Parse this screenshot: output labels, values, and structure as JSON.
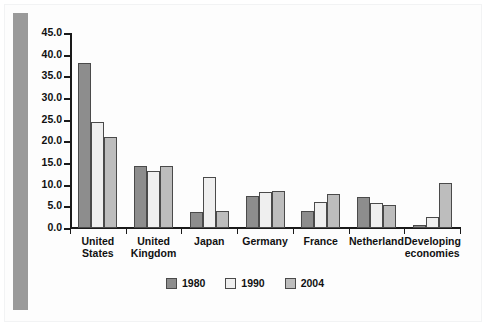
{
  "chart_data": {
    "type": "bar",
    "title": "",
    "subtitle": "",
    "xlabel": "",
    "ylabel": "",
    "ylim": [
      0.0,
      45.0
    ],
    "ytick_step": 5.0,
    "ytick_labels": [
      "0.0",
      "5.0",
      "10.0",
      "15.0",
      "20.0",
      "25.0",
      "30.0",
      "35.0",
      "40.0",
      "45.0"
    ],
    "ytick_values": [
      0.0,
      5.0,
      10.0,
      15.0,
      20.0,
      25.0,
      30.0,
      35.0,
      40.0,
      45.0
    ],
    "grid": false,
    "legend_position": "bottom-center",
    "categories": [
      "United States",
      "United Kingdom",
      "Japan",
      "Germany",
      "France",
      "Netherland",
      "Developing economies"
    ],
    "category_lines": [
      [
        "United",
        "States"
      ],
      [
        "United",
        "Kingdom"
      ],
      [
        "Japan"
      ],
      [
        "Germany"
      ],
      [
        "France"
      ],
      [
        "Netherland"
      ],
      [
        "Developing",
        "economies"
      ]
    ],
    "series": [
      {
        "name": "1980",
        "color": "#8d8d8d",
        "values": [
          38.0,
          14.3,
          3.6,
          7.4,
          4.0,
          7.1,
          0.6
        ]
      },
      {
        "name": "1990",
        "color": "#efefef",
        "values": [
          24.5,
          13.2,
          11.7,
          8.3,
          6.1,
          5.8,
          2.6
        ]
      },
      {
        "name": "2004",
        "color": "#bdbdbd",
        "values": [
          21.0,
          14.3,
          4.0,
          8.6,
          7.9,
          5.4,
          10.3
        ]
      }
    ]
  },
  "legend": {
    "items": [
      {
        "label": "1980",
        "color": "#8d8d8d"
      },
      {
        "label": "1990",
        "color": "#efefef"
      },
      {
        "label": "2004",
        "color": "#bdbdbd"
      }
    ]
  },
  "colors": {
    "axis": "#1a1a1a",
    "bar_outline": "#4a4a4a",
    "left_rule": "#9a9a9a",
    "background": "#ffffff",
    "page_border": "#f2f3f4"
  }
}
